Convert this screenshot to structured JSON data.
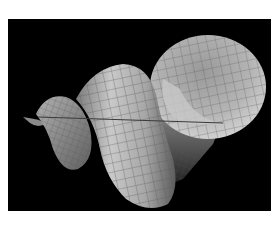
{
  "image": {
    "subject": "3D wireframe-shaded spiral horn surface",
    "background_color": "#000000",
    "margin_color": "#ffffff",
    "surface_colors": {
      "highlight": "#d8d8d8",
      "mid": "#a8a8a8",
      "shadow": "#505050",
      "grid_line": "#6a6a6a"
    }
  }
}
